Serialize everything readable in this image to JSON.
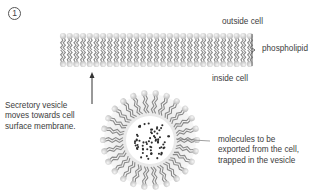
{
  "step": {
    "number": "1"
  },
  "membrane": {
    "label_outside": "outside cell",
    "label_inside": "inside cell",
    "label_structure": "phospholipid",
    "x_start": 63,
    "x_end": 250,
    "y_top": 33,
    "y_bottom": 67,
    "column_count": 29
  },
  "vesicle": {
    "caption_lines": [
      "Secretory vesicle",
      "moves towards cell",
      "surface membrane."
    ],
    "contents_lines": [
      "molecules to be",
      "exported from the cell,",
      "trapped in the vesicle"
    ],
    "center_x": 150,
    "center_y": 140,
    "outer_radius": 50,
    "core_radius": 24,
    "phospholipid_count": 26,
    "molecule_count": 70
  },
  "colors": {
    "head": "#d8d8d8",
    "head_highlight": "#f4f4f4",
    "tail": "#8a8a8a",
    "arrow": "#333333",
    "leader_line": "#777777",
    "halo": "#e6e6e6",
    "molecule": "#2e2e2e"
  }
}
